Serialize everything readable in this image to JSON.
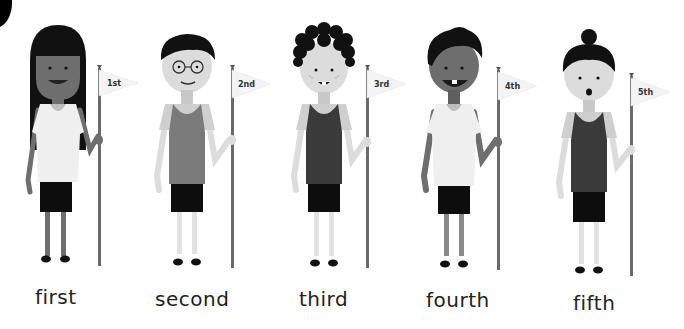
{
  "figures": [
    {
      "flag_label": "1st",
      "word": "first"
    },
    {
      "flag_label": "2nd",
      "word": "second"
    },
    {
      "flag_label": "3rd",
      "word": "third"
    },
    {
      "flag_label": "4th",
      "word": "fourth"
    },
    {
      "flag_label": "5th",
      "word": "fifth"
    }
  ],
  "colors": {
    "background": "#ffffff",
    "hair": "#111111",
    "dark_skin": "#6e6e6e",
    "light_skin": "#dcdcdc",
    "white_shirt": "#f0f0f0",
    "grey_tank": "#7a7a7a",
    "dark_tank": "#3a3a3a",
    "shorts": "#0d0d0d",
    "pole": "#6a6a6a",
    "flag": "#f4f4f4"
  }
}
